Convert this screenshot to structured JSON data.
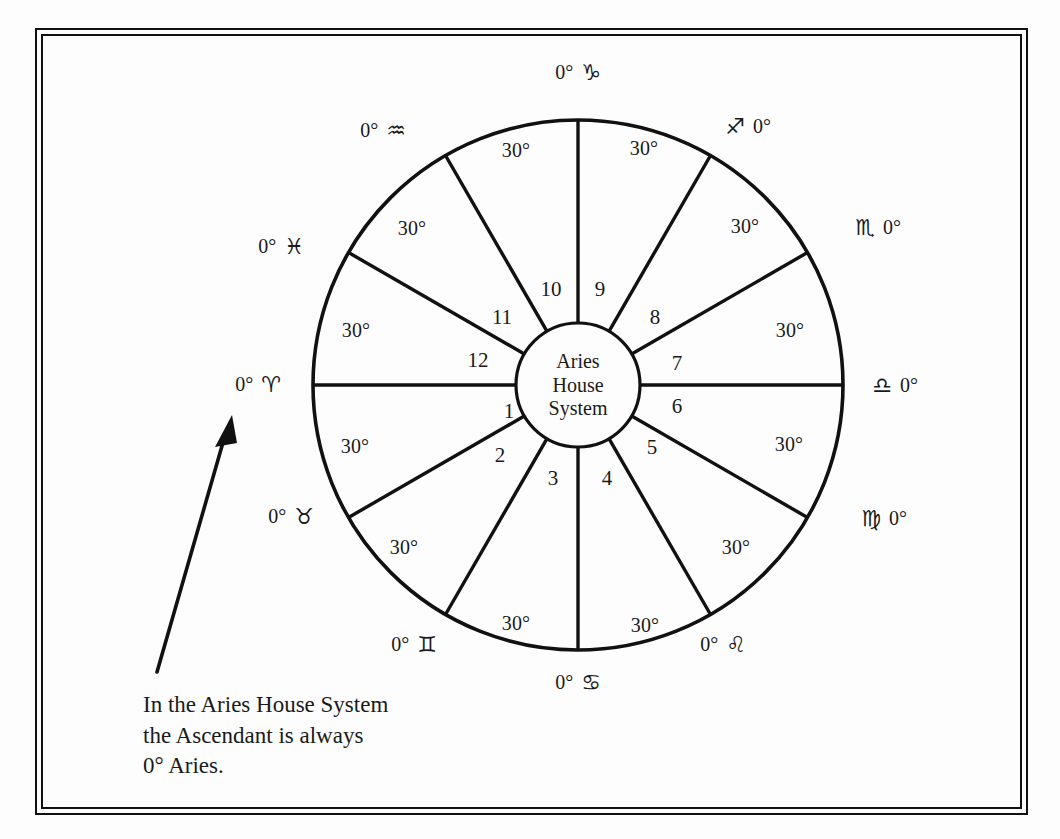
{
  "figure": {
    "center_label_lines": [
      "Aries",
      "House",
      "System"
    ],
    "caption_lines": [
      "In the Aries House System",
      "the Ascendant is always",
      "0° Aries."
    ],
    "segment_degree_label": "30°",
    "line_color": "#111111",
    "background_color": "#fdfdfd"
  },
  "chart_data": {
    "type": "pie",
    "title": "Aries House System",
    "subtitle": "",
    "xlabel": "",
    "ylabel": "",
    "grid": false,
    "legend_position": "none",
    "note": "Equal-house astrological wheel: 12 sectors of 30 degrees each, first house cusp fixed at 0 degrees Aries on the western (left) horizon, houses numbered counter-clockwise.",
    "center_text": "Aries House System",
    "total_degrees": 360,
    "sector_count": 12,
    "sector_size_degrees": 30,
    "categories": [
      "1",
      "2",
      "3",
      "4",
      "5",
      "6",
      "7",
      "8",
      "9",
      "10",
      "11",
      "12"
    ],
    "values": [
      30,
      30,
      30,
      30,
      30,
      30,
      30,
      30,
      30,
      30,
      30,
      30
    ],
    "sector_labels": [
      "30°",
      "30°",
      "30°",
      "30°",
      "30°",
      "30°",
      "30°",
      "30°",
      "30°",
      "30°",
      "30°",
      "30°"
    ],
    "house_numbers": [
      1,
      2,
      3,
      4,
      5,
      6,
      7,
      8,
      9,
      10,
      11,
      12
    ],
    "cusps": [
      {
        "house": 1,
        "sign": "Aries",
        "glyph": "♈",
        "degree": "0°",
        "label": "0° ♈",
        "order": "degree-first"
      },
      {
        "house": 2,
        "sign": "Taurus",
        "glyph": "♉",
        "degree": "0°",
        "label": "0° ♉",
        "order": "degree-first"
      },
      {
        "house": 3,
        "sign": "Gemini",
        "glyph": "♊",
        "degree": "0°",
        "label": "0° ♊",
        "order": "degree-first"
      },
      {
        "house": 4,
        "sign": "Cancer",
        "glyph": "♋",
        "degree": "0°",
        "label": "0° ♋",
        "order": "degree-first"
      },
      {
        "house": 5,
        "sign": "Leo",
        "glyph": "♌",
        "degree": "0°",
        "label": "0° ♌",
        "order": "degree-first"
      },
      {
        "house": 6,
        "sign": "Virgo",
        "glyph": "♍",
        "degree": "0°",
        "label": "♍ 0°",
        "order": "glyph-first"
      },
      {
        "house": 7,
        "sign": "Libra",
        "glyph": "♎",
        "degree": "0°",
        "label": "♎ 0°",
        "order": "glyph-first"
      },
      {
        "house": 8,
        "sign": "Scorpio",
        "glyph": "♏",
        "degree": "0°",
        "label": "♏ 0°",
        "order": "glyph-first"
      },
      {
        "house": 9,
        "sign": "Sagittarius",
        "glyph": "♐",
        "degree": "0°",
        "label": "♐ 0°",
        "order": "glyph-first"
      },
      {
        "house": 10,
        "sign": "Capricorn",
        "glyph": "♑",
        "degree": "0°",
        "label": "0° ♑",
        "order": "degree-first"
      },
      {
        "house": 11,
        "sign": "Aquarius",
        "glyph": "♒",
        "degree": "0°",
        "label": "0° ♒",
        "order": "degree-first"
      },
      {
        "house": 12,
        "sign": "Pisces",
        "glyph": "♓",
        "degree": "0°",
        "label": "0° ♓",
        "order": "degree-first"
      }
    ]
  },
  "labels": {
    "zodiac": [
      {
        "name": "aries",
        "text": "0° ♈",
        "x": 258,
        "y": 385
      },
      {
        "name": "taurus",
        "text": "0° ♉",
        "x": 291,
        "y": 517
      },
      {
        "name": "gemini",
        "text": "0° ♊",
        "x": 414,
        "y": 645
      },
      {
        "name": "cancer",
        "text": "0° ♋",
        "x": 578,
        "y": 683
      },
      {
        "name": "leo",
        "text": "0° ♌",
        "x": 723,
        "y": 645
      },
      {
        "name": "virgo",
        "text": "♍ 0°",
        "x": 884,
        "y": 519
      },
      {
        "name": "libra",
        "text": "♎ 0°",
        "x": 895,
        "y": 386
      },
      {
        "name": "scorpio",
        "text": "♏ 0°",
        "x": 878,
        "y": 228
      },
      {
        "name": "sagittarius",
        "text": "♐ 0°",
        "x": 748,
        "y": 127
      },
      {
        "name": "capricorn",
        "text": "0° ♑",
        "x": 578,
        "y": 73
      },
      {
        "name": "aquarius",
        "text": "0° ♒",
        "x": 383,
        "y": 131
      },
      {
        "name": "pisces",
        "text": "0° ♓",
        "x": 281,
        "y": 247
      }
    ],
    "segment_degrees": [
      {
        "name": "segment-degree-10",
        "text": "30°",
        "x": 516,
        "y": 150
      },
      {
        "name": "segment-degree-9",
        "text": "30°",
        "x": 644,
        "y": 148
      },
      {
        "name": "segment-degree-8",
        "text": "30°",
        "x": 745,
        "y": 226
      },
      {
        "name": "segment-degree-7",
        "text": "30°",
        "x": 790,
        "y": 330
      },
      {
        "name": "segment-degree-6",
        "text": "30°",
        "x": 789,
        "y": 444
      },
      {
        "name": "segment-degree-5",
        "text": "30°",
        "x": 736,
        "y": 547
      },
      {
        "name": "segment-degree-4",
        "text": "30°",
        "x": 645,
        "y": 625
      },
      {
        "name": "segment-degree-3",
        "text": "30°",
        "x": 516,
        "y": 623
      },
      {
        "name": "segment-degree-2",
        "text": "30°",
        "x": 404,
        "y": 547
      },
      {
        "name": "segment-degree-1",
        "text": "30°",
        "x": 355,
        "y": 446
      },
      {
        "name": "segment-degree-12",
        "text": "30°",
        "x": 356,
        "y": 330
      },
      {
        "name": "segment-degree-11",
        "text": "30°",
        "x": 412,
        "y": 228
      }
    ],
    "house_numbers": [
      {
        "name": "house-number-1",
        "text": "1",
        "x": 509,
        "y": 411
      },
      {
        "name": "house-number-2",
        "text": "2",
        "x": 500,
        "y": 455
      },
      {
        "name": "house-number-3",
        "text": "3",
        "x": 553,
        "y": 478
      },
      {
        "name": "house-number-4",
        "text": "4",
        "x": 607,
        "y": 478
      },
      {
        "name": "house-number-5",
        "text": "5",
        "x": 652,
        "y": 447
      },
      {
        "name": "house-number-6",
        "text": "6",
        "x": 677,
        "y": 406
      },
      {
        "name": "house-number-7",
        "text": "7",
        "x": 677,
        "y": 363
      },
      {
        "name": "house-number-8",
        "text": "8",
        "x": 655,
        "y": 317
      },
      {
        "name": "house-number-9",
        "text": "9",
        "x": 600,
        "y": 289
      },
      {
        "name": "house-number-10",
        "text": "10",
        "x": 551,
        "y": 289
      },
      {
        "name": "house-number-11",
        "text": "11",
        "x": 502,
        "y": 317
      },
      {
        "name": "house-number-12",
        "text": "12",
        "x": 478,
        "y": 360
      }
    ]
  }
}
